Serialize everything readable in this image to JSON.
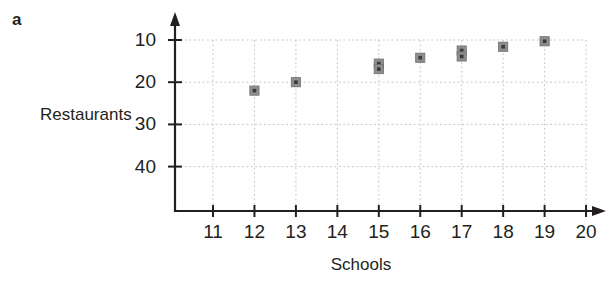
{
  "panel": {
    "label": "a"
  },
  "axes": {
    "x_title": "Schools",
    "y_title": "Restaurants",
    "x_ticks": [
      "11",
      "12",
      "13",
      "14",
      "15",
      "16",
      "17",
      "18",
      "19",
      "20"
    ],
    "y_ticks": [
      "40",
      "30",
      "20",
      "10"
    ]
  },
  "style": {
    "axis_color": "#231f20",
    "grid_color": "#c9c9cb",
    "marker_fill": "#8e8e90",
    "marker_core": "#3a3a3c",
    "background": "#ffffff"
  },
  "chart_data": {
    "type": "scatter",
    "title": "a",
    "xlabel": "Schools",
    "ylabel": "Restaurants",
    "xlim": [
      10,
      20
    ],
    "ylim": [
      0,
      42
    ],
    "xticks": [
      11,
      12,
      13,
      14,
      15,
      16,
      17,
      18,
      19,
      20
    ],
    "yticks": [
      10,
      20,
      30,
      40
    ],
    "grid": true,
    "legend": "none",
    "points": [
      {
        "x": 12,
        "y": 28
      },
      {
        "x": 13,
        "y": 30
      },
      {
        "x": 15,
        "y": 34.4
      },
      {
        "x": 15,
        "y": 33.1
      },
      {
        "x": 16,
        "y": 35.8
      },
      {
        "x": 17,
        "y": 37.5
      },
      {
        "x": 17,
        "y": 36.1
      },
      {
        "x": 18,
        "y": 38.4
      },
      {
        "x": 19,
        "y": 39.7
      }
    ]
  }
}
